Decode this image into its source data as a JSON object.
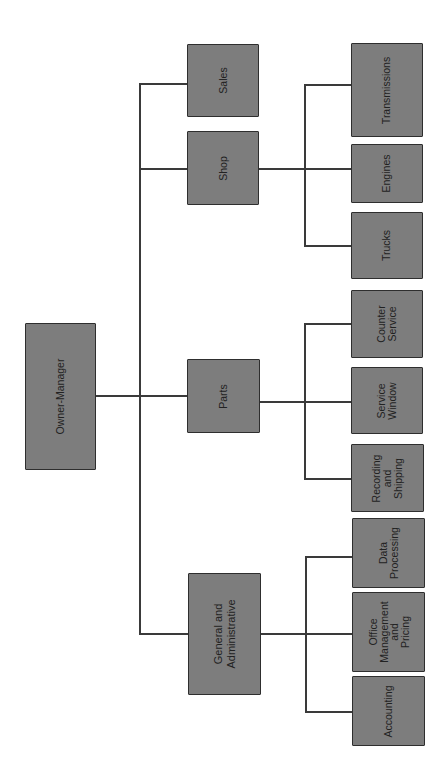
{
  "diagram": {
    "type": "organization-chart",
    "orientation": "rotated-90-ccw",
    "colors": {
      "box_fill": "#7d7d7d",
      "box_border": "#2e2e2e",
      "line": "#3a3a3a",
      "text": "#222222",
      "background": "#ffffff"
    },
    "root": {
      "label": "Owner-Manager"
    },
    "departments": [
      {
        "label": "Sales",
        "children": []
      },
      {
        "label": "Shop",
        "children": [
          {
            "label": "Transmissions"
          },
          {
            "label": "Engines"
          },
          {
            "label": "Trucks"
          }
        ]
      },
      {
        "label": "Parts",
        "children": [
          {
            "label": "Counter\nService"
          },
          {
            "label": "Service\nWindow"
          },
          {
            "label": "Recording\nand\nShipping"
          }
        ]
      },
      {
        "label": "General and\nAdministrative",
        "children": [
          {
            "label": "Data\nProcessing"
          },
          {
            "label": "Office\nManagement\nand\nPricing"
          },
          {
            "label": "Accounting"
          }
        ]
      }
    ]
  }
}
